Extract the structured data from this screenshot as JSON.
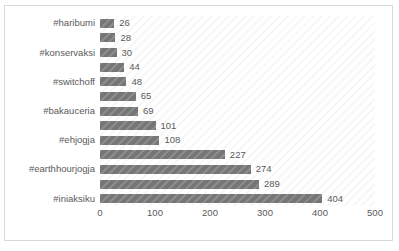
{
  "chart_data": {
    "type": "bar",
    "orientation": "horizontal",
    "title": "",
    "subtitle": "",
    "xlabel": "",
    "ylabel": "",
    "xlim": [
      0,
      500
    ],
    "xticks": [
      0,
      100,
      200,
      300,
      400,
      500
    ],
    "grid": false,
    "legend": "none",
    "bar_color": "#767676",
    "text_color": "#5a5a5a",
    "plot_background": "#ffffff",
    "plot_pattern": "diagonal-hatch",
    "categories": [
      "#haribumi",
      "",
      "#konservaksi",
      "",
      "#switchoff",
      "",
      "#bakauceria",
      "",
      "#ehjogja",
      "",
      "#earthhourjogja",
      "",
      "#iniaksiku"
    ],
    "visible_category_labels": [
      "#haribumi",
      "#konservaksi",
      "#switchoff",
      "#bakauceria",
      "#ehjogja",
      "#earthhourjogja",
      "#iniaksiku"
    ],
    "values": [
      26,
      28,
      30,
      44,
      48,
      65,
      69,
      101,
      108,
      227,
      274,
      289,
      404
    ],
    "data_labels": [
      "26",
      "28",
      "30",
      "44",
      "48",
      "65",
      "69",
      "101",
      "108",
      "227",
      "274",
      "289",
      "404"
    ]
  }
}
